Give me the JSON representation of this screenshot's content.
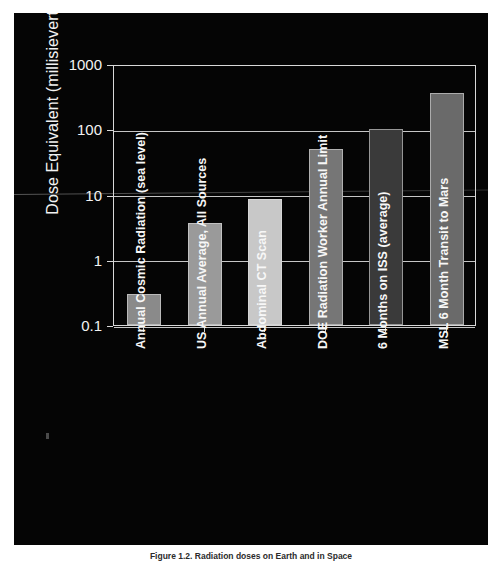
{
  "figure": {
    "caption": "Figure 1.2. Radiation doses on Earth and in Space"
  },
  "chart_data": {
    "type": "bar",
    "title": "",
    "xlabel": "",
    "ylabel": "Dose Equivalent (millisieverts)",
    "yscale": "log",
    "ylim": [
      0.1,
      1000
    ],
    "ytick_labels": [
      "1000",
      "100",
      "10",
      "1",
      "0.1"
    ],
    "ytick_values": [
      1000,
      100,
      10,
      1,
      0.1
    ],
    "grid": true,
    "legend": "none",
    "categories": [
      "Annual Cosmic Radiation (sea level)",
      "US Annual Average, All Sources",
      "Abdominal CT Scan",
      "DOE Radiation Worker Annual Limit",
      "6 Months on ISS (average)",
      "MSL  6 Month Transit to Mars"
    ],
    "values": [
      0.3,
      3.7,
      8.5,
      50,
      100,
      360
    ],
    "units": "mSv",
    "bar_colors": [
      "#8a8a8a",
      "#9a9a9a",
      "#c8c8c8",
      "#767676",
      "#3a3a3a",
      "#6a6a6a"
    ],
    "background_color": "#050505",
    "axis_color": "#d8d8d8",
    "text_color": "#f2f2f2"
  }
}
